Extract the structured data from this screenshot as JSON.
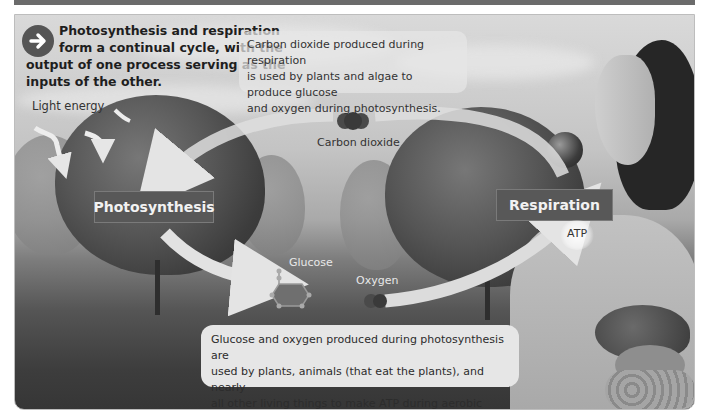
{
  "header": {
    "intro_text": "Photosynthesis and respiration form a continual cycle, with the output of one process serving as the inputs of the other.",
    "intro_line1": "Photosynthesis and respiration",
    "intro_line2": "form a continual cycle, with the",
    "intro_line3": "output of one process serving as the",
    "intro_line4": "inputs of the other."
  },
  "notes": {
    "top": {
      "line1": "Carbon dioxide produced during respiration",
      "line2": "is used by plants and algae to produce glucose",
      "line3": "and oxygen during photosynthesis."
    },
    "bottom": {
      "line1": "Glucose and oxygen produced during photosynthesis are",
      "line2": "used by plants, animals (that eat the plants), and nearly",
      "line3": "all other living things to make ATP during aerobic respiration."
    }
  },
  "labels": {
    "light_energy": "Light energy",
    "carbon_dioxide": "Carbon dioxide",
    "glucose": "Glucose",
    "oxygen": "Oxygen",
    "atp": "ATP"
  },
  "processes": {
    "photosynthesis": "Photosynthesis",
    "respiration": "Respiration"
  },
  "icons": {
    "intro": "arrow-right-circle-icon",
    "co2": "carbon-dioxide-molecule-icon",
    "glucose": "glucose-molecule-icon",
    "oxygen": "oxygen-molecule-icon",
    "atp": "atp-burst-icon"
  },
  "colors": {
    "process_box": "#585858",
    "arrow": "#e0e0e0",
    "note_box": "#e6e6e6",
    "top_bar": "#6b6b6b"
  }
}
